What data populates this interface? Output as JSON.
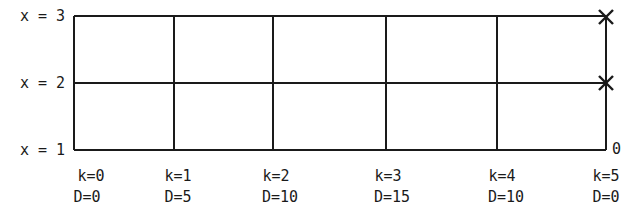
{
  "diagram": {
    "type": "state-stage grid",
    "rows": [
      {
        "label": "x = 3",
        "value": 3
      },
      {
        "label": "x = 2",
        "value": 2
      },
      {
        "label": "x = 1",
        "value": 1
      }
    ],
    "columns": [
      {
        "k": "k=0",
        "D": "D=0"
      },
      {
        "k": "k=1",
        "D": "D=5"
      },
      {
        "k": "k=2",
        "D": "D=10"
      },
      {
        "k": "k=3",
        "D": "D=15"
      },
      {
        "k": "k=4",
        "D": "D=10"
      },
      {
        "k": "k=5",
        "D": "D=0"
      }
    ],
    "end_markers": [
      {
        "row": "x = 3",
        "column": "k=5",
        "symbol": "×"
      },
      {
        "row": "x = 2",
        "column": "k=5",
        "symbol": "×"
      }
    ],
    "corner_label": "0",
    "line_color": "#1a1a1a"
  }
}
